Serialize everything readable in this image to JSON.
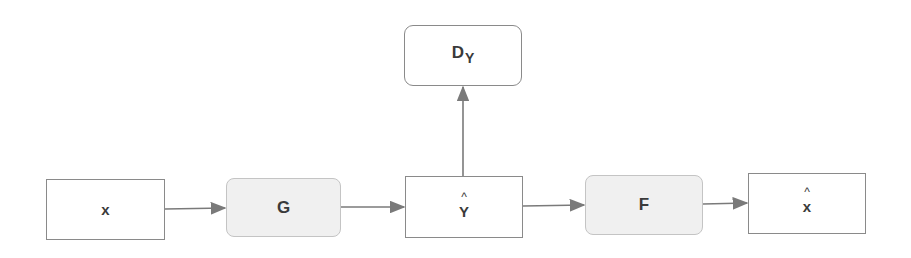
{
  "diagram": {
    "type": "flowchart",
    "nodes": [
      {
        "id": "x",
        "label": "x",
        "hat": "",
        "style": "square"
      },
      {
        "id": "G",
        "label": "G",
        "hat": "",
        "style": "rounded-fill"
      },
      {
        "id": "y_hat",
        "label": "Y",
        "hat": "^",
        "style": "square"
      },
      {
        "id": "D_Y",
        "label": "D",
        "subscript": "Y",
        "style": "rounded"
      },
      {
        "id": "F",
        "label": "F",
        "hat": "",
        "style": "rounded-fill"
      },
      {
        "id": "x_hat",
        "label": "x",
        "hat": "^",
        "style": "square"
      }
    ],
    "edges": [
      {
        "from": "x",
        "to": "G"
      },
      {
        "from": "G",
        "to": "y_hat"
      },
      {
        "from": "y_hat",
        "to": "D_Y"
      },
      {
        "from": "y_hat",
        "to": "F"
      },
      {
        "from": "F",
        "to": "x_hat"
      }
    ],
    "colors": {
      "border": "#8a8a8a",
      "fill_gray": "#f0f0f0",
      "arrow": "#7a7a7a",
      "text": "#3a3a3a"
    }
  }
}
